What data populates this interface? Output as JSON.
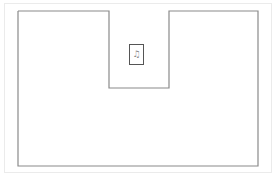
{
  "diagram": {
    "type": "floor-plan-outline",
    "outline_color": "#8a8a8a",
    "frame_color": "#ebebeb",
    "marker": {
      "symbol": "♫",
      "label": ""
    }
  }
}
